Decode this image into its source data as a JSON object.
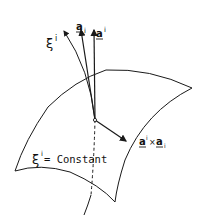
{
  "figure": {
    "type": "coordinate-surface-diagram",
    "colors": {
      "stroke": "#1a1a1a",
      "background": "#ffffff"
    },
    "labels": {
      "xi_curve": {
        "base": "ξ",
        "sup": "i"
      },
      "covariant_base": {
        "base": "a",
        "sub": "i"
      },
      "contravariant_base": {
        "base": "a",
        "sup": "i"
      },
      "cross_product": {
        "left_base": "a",
        "left_sup": "i",
        "op": "×",
        "right_base": "a",
        "right_sub": "i"
      },
      "surface_label": {
        "base": "ξ",
        "sup": "i",
        "text": "= Constant"
      }
    },
    "elements": [
      "coordinate-surface",
      "xi-coordinate-curve",
      "covariant-base-vector",
      "contravariant-base-vector",
      "cross-product-vector",
      "origin-point"
    ]
  }
}
